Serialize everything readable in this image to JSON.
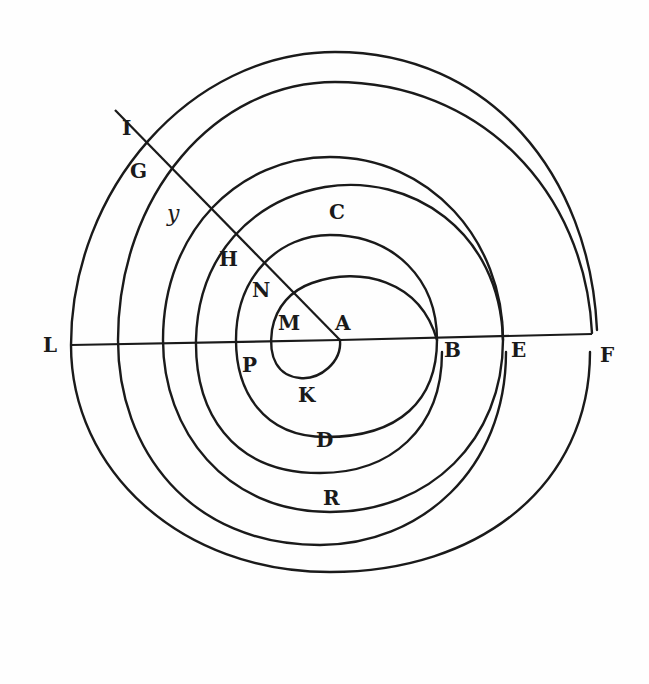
{
  "figure": {
    "type": "geometric-diagram",
    "colors": {
      "ink": "#1a1a1a",
      "paper": "#fefefe"
    }
  },
  "labels": {
    "A": "A",
    "B": "B",
    "C": "C",
    "D": "D",
    "E": "E",
    "F": "F",
    "G": "G",
    "H": "H",
    "I": "I",
    "K": "K",
    "L": "L",
    "M": "M",
    "N": "N",
    "P": "P",
    "R": "R",
    "y": "y"
  }
}
